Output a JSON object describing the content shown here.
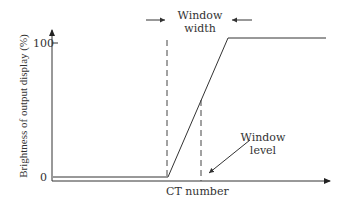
{
  "diagram": {
    "y_axis_label": "Brightness of output display (%)",
    "x_axis_label": "CT number",
    "y_ticks": [
      "100",
      "0"
    ],
    "annotations": {
      "window_width_line1": "Window",
      "window_width_line2": "width",
      "window_level_line1": "Window",
      "window_level_line2": "level"
    },
    "colors": {
      "line": "#333333",
      "background": "#ffffff"
    }
  }
}
